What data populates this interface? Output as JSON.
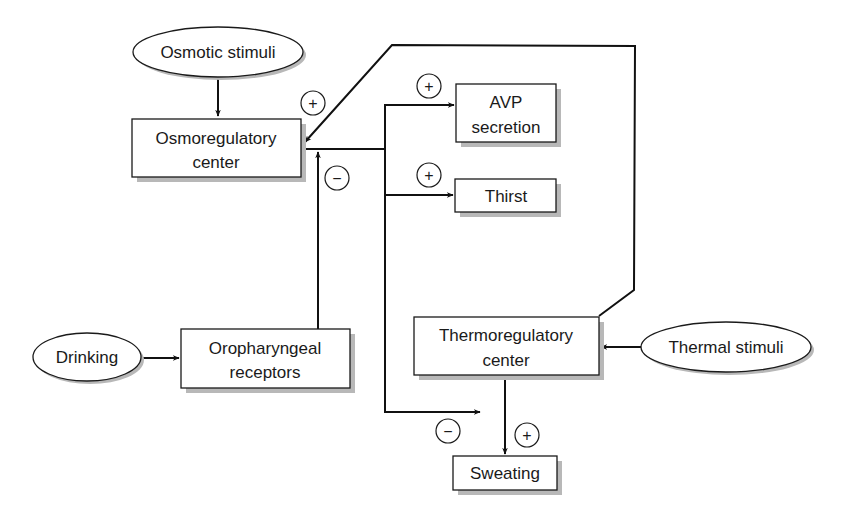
{
  "diagram": {
    "title": "",
    "nodes": {
      "osmotic_stimuli": {
        "label": [
          "Osmotic stimuli"
        ],
        "shape": "ellipse"
      },
      "osmoregulatory_center": {
        "label": [
          "Osmoregulatory",
          "center"
        ],
        "shape": "box"
      },
      "avp_secretion": {
        "label": [
          "AVP",
          "secretion"
        ],
        "shape": "box"
      },
      "thirst": {
        "label": [
          "Thirst"
        ],
        "shape": "box"
      },
      "drinking": {
        "label": [
          "Drinking"
        ],
        "shape": "ellipse"
      },
      "oropharyngeal_receptors": {
        "label": [
          "Oropharyngeal",
          "receptors"
        ],
        "shape": "box"
      },
      "thermoregulatory_center": {
        "label": [
          "Thermoregulatory",
          "center"
        ],
        "shape": "box"
      },
      "thermal_stimuli": {
        "label": [
          "Thermal stimuli"
        ],
        "shape": "ellipse"
      },
      "sweating": {
        "label": [
          "Sweating"
        ],
        "shape": "box"
      }
    },
    "edges": [
      {
        "from": "osmotic_stimuli",
        "to": "osmoregulatory_center",
        "sign": ""
      },
      {
        "from": "thermoregulatory_center",
        "to": "osmoregulatory_center",
        "sign": "+"
      },
      {
        "from": "oropharyngeal_receptors",
        "to": "osmoregulatory_center",
        "sign": "−"
      },
      {
        "from": "osmoregulatory_center",
        "to": "avp_secretion",
        "sign": "+"
      },
      {
        "from": "osmoregulatory_center",
        "to": "thirst",
        "sign": "+"
      },
      {
        "from": "osmoregulatory_center",
        "to": "sweating",
        "sign": "−"
      },
      {
        "from": "drinking",
        "to": "oropharyngeal_receptors",
        "sign": ""
      },
      {
        "from": "thermal_stimuli",
        "to": "thermoregulatory_center",
        "sign": ""
      },
      {
        "from": "thermoregulatory_center",
        "to": "sweating",
        "sign": "+"
      }
    ],
    "signs": {
      "plus": "+",
      "minus": "−"
    },
    "colors": {
      "line": "#111111",
      "box_fill": "#ffffff",
      "shadow": "#b8b8b8"
    }
  }
}
